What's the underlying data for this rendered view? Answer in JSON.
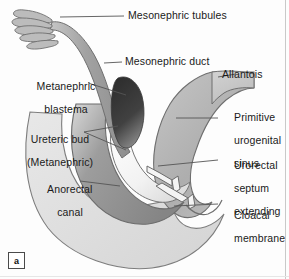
{
  "figure": {
    "tag": "a",
    "caption_id": "a",
    "width": 289,
    "height": 279,
    "background": "#fdfdfd"
  },
  "palette": {
    "outline": "#6e6e6e",
    "body_light": "#dcdcdc",
    "body_light_2": "#e4e4e4",
    "sinus_mid": "#b3b3b3",
    "duct_gray": "#9a9a9a",
    "anorectal_dark": "#8a8a8a",
    "blastema_dark": "#3a3a3a",
    "ureteric_white": "#f6f6f6",
    "leader_line": "#555555",
    "text": "#1a1a1a"
  },
  "labels": [
    {
      "id": "mesonephric-tubules",
      "text": "Mesonephric tubules",
      "lines": [
        "Mesonephric tubules"
      ],
      "x": 128,
      "y": 10,
      "align": "left"
    },
    {
      "id": "mesonephric-duct",
      "text": "Mesonephric duct",
      "lines": [
        "Mesonephric duct"
      ],
      "x": 125,
      "y": 57,
      "align": "left"
    },
    {
      "id": "metanephric-blastema",
      "text": "Metanephric blastema",
      "lines": [
        "Metanephric",
        "blastema"
      ],
      "x": 18,
      "y": 71,
      "align": "left"
    },
    {
      "id": "ureteric-bud",
      "text": "Ureteric bud (Metanephric)",
      "lines": [
        "Ureteric bud",
        "(Metanephric)"
      ],
      "x": 12,
      "y": 124,
      "align": "left"
    },
    {
      "id": "anorectal-canal",
      "text": "Anorectal canal",
      "lines": [
        "Anorectal",
        "canal"
      ],
      "x": 28,
      "y": 174,
      "align": "left"
    },
    {
      "id": "allantois",
      "text": "Allantois",
      "lines": [
        "Allantois"
      ],
      "x": 222,
      "y": 72,
      "align": "left"
    },
    {
      "id": "primitive-urogenital-sinus",
      "text": "Primitive urogenital sinus",
      "lines": [
        "Primitive",
        "urogenital",
        "sinus"
      ],
      "x": 222,
      "y": 103,
      "align": "left"
    },
    {
      "id": "urorectal-septum",
      "text": "Urorectal septum extending",
      "lines": [
        "Urorectal",
        "septum",
        "extending"
      ],
      "x": 222,
      "y": 150,
      "align": "left"
    },
    {
      "id": "cloacal-membrane",
      "text": "Cloacal membrane",
      "lines": [
        "Cloacal",
        "membrane"
      ],
      "x": 222,
      "y": 200,
      "align": "left"
    }
  ],
  "structures": [
    {
      "id": "mesonephric-tubules-shape",
      "name": "mesonephric tubules",
      "description": "finger-like projections at upper left"
    },
    {
      "id": "mesonephric-duct-shape",
      "name": "mesonephric duct",
      "description": "long curving tube descending from tubules"
    },
    {
      "id": "metanephric-blastema-shape",
      "name": "metanephric blastema",
      "description": "dark ovoid mass"
    },
    {
      "id": "ureteric-bud-shape",
      "name": "ureteric bud",
      "description": "pale tube rising into blastema"
    },
    {
      "id": "allantois-shape",
      "name": "allantois",
      "description": "upper right tapering extension"
    },
    {
      "id": "primitive-urogenital-sinus-shape",
      "name": "primitive urogenital sinus",
      "description": "mid gray cavity"
    },
    {
      "id": "anorectal-canal-shape",
      "name": "anorectal canal",
      "description": "dark gray curved canal"
    },
    {
      "id": "urorectal-septum-shape",
      "name": "urorectal septum",
      "description": "paired white arrows pointing toward cloacal membrane"
    },
    {
      "id": "cloacal-membrane-shape",
      "name": "cloacal membrane",
      "description": "notch at lower right margin"
    },
    {
      "id": "embryo-body-shape",
      "name": "embryo body outline",
      "description": "large pale crescent body"
    }
  ]
}
